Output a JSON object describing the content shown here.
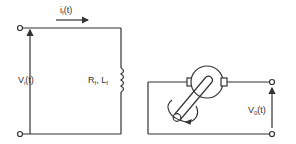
{
  "diagram": {
    "colors": {
      "stroke": "#333333",
      "background": "#ffffff"
    },
    "labels": {
      "current": {
        "main": "i",
        "sub": "f",
        "arg": "(t)"
      },
      "input_voltage": {
        "main": "V",
        "sub": "i",
        "arg": "(t)"
      },
      "field_winding": {
        "r_main": "R",
        "r_sub": "f",
        "sep": ", ",
        "l_main": "L",
        "l_sub": "f"
      },
      "output_voltage": {
        "main": "V",
        "sub": "0",
        "arg": "(t)"
      }
    },
    "components": [
      {
        "id": "input-terminals",
        "type": "terminal-pair"
      },
      {
        "id": "field-coil",
        "type": "inductor-resistor"
      },
      {
        "id": "armature",
        "type": "rotating-machine"
      },
      {
        "id": "shaft",
        "type": "shaft-with-rotation-arrow"
      },
      {
        "id": "output-terminals",
        "type": "terminal-pair"
      }
    ]
  }
}
